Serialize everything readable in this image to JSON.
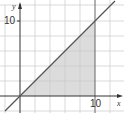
{
  "diagram": {
    "type": "coordinate-plane",
    "x_axis_label": "x",
    "y_axis_label": "y",
    "x_tick_label": "10",
    "y_tick_label": "10",
    "grid_step_units": 2,
    "line": {
      "equation": "y = x",
      "color": "#555555"
    },
    "shaded_region": {
      "vertices": [
        [
          0,
          0
        ],
        [
          10,
          0
        ],
        [
          10,
          10
        ]
      ],
      "color": "#d9d9d9"
    },
    "vertical_line": {
      "equation": "x = 10"
    }
  }
}
